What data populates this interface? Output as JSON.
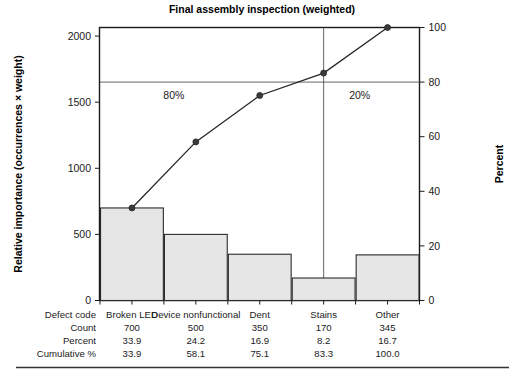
{
  "chart_data": {
    "type": "bar",
    "title": "Final assembly inspection (weighted)",
    "categories": [
      "Broken LED",
      "Device nonfunctional",
      "Dent",
      "Stains",
      "Other"
    ],
    "values": [
      700,
      500,
      350,
      170,
      345
    ],
    "series": [
      {
        "name": "Relative importance",
        "type": "bar",
        "values": [
          700,
          500,
          350,
          170,
          345
        ]
      },
      {
        "name": "Cumulative %",
        "type": "line",
        "values": [
          33.9,
          58.1,
          75.1,
          83.3,
          100.0
        ]
      }
    ],
    "xlabel": "",
    "ylabel": "Relative importance (occurrences × weight)",
    "y2label": "Percent",
    "ylim": [
      0,
      2065
    ],
    "y2lim": [
      0,
      100
    ],
    "yticks": [
      0,
      500,
      1000,
      1500,
      2000
    ],
    "y2ticks": [
      0,
      20,
      40,
      60,
      80,
      100
    ],
    "grid": false,
    "legend": "none",
    "annotations": [
      {
        "text": "80%",
        "x_category": "Device nonfunctional",
        "percent": 80
      },
      {
        "text": "20%",
        "x_category": "Stains",
        "percent": 80
      }
    ],
    "reference_lines": [
      {
        "orientation": "horizontal",
        "percent_value": 80
      },
      {
        "orientation": "vertical",
        "at_category": "Stains"
      }
    ],
    "table": {
      "row_labels": [
        "Defect code",
        "Count",
        "Percent",
        "Cumulative %"
      ],
      "rows": [
        [
          "Broken LED",
          "Device nonfunctional",
          "Dent",
          "Stains",
          "Other"
        ],
        [
          "700",
          "500",
          "350",
          "170",
          "345"
        ],
        [
          "33.9",
          "24.2",
          "16.9",
          "8.2",
          "16.7"
        ],
        [
          "33.9",
          "58.1",
          "75.1",
          "83.3",
          "100.0"
        ]
      ]
    }
  },
  "colors": {
    "bar_fill": "#e6e6e6",
    "bar_stroke": "#2b2b2b",
    "line": "#262626",
    "frame": "#1a1a1a",
    "reference": "#555555",
    "background": "#ffffff"
  }
}
